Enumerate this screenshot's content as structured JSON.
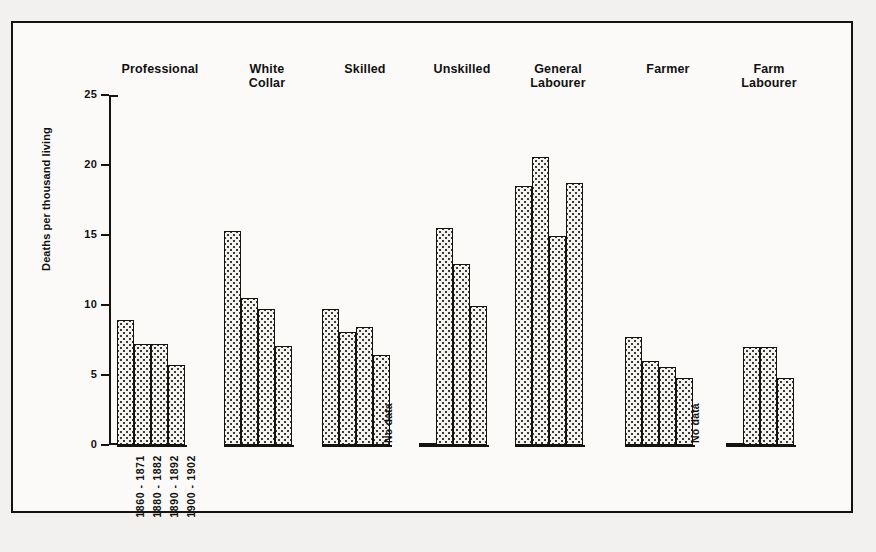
{
  "chart_data": {
    "type": "bar",
    "title": "",
    "xlabel": "",
    "ylabel": "Deaths per thousand living",
    "ylim": [
      0,
      25
    ],
    "yticks": [
      "0",
      "5",
      "10",
      "15",
      "20",
      "25"
    ],
    "grid": false,
    "legend_position": "none",
    "categories": [
      "Professional",
      "White Collar",
      "Skilled",
      "Unskilled",
      "General Labourer",
      "Farmer",
      "Farm Labourer"
    ],
    "periods": [
      "1860 - 1871",
      "1880 - 1882",
      "1890 - 1892",
      "1900 - 1902"
    ],
    "no_data_label": "No data",
    "series": [
      {
        "name": "1860 - 1871",
        "values": [
          8.9,
          15.3,
          9.7,
          null,
          18.5,
          7.7,
          null
        ]
      },
      {
        "name": "1880 - 1882",
        "values": [
          7.2,
          10.5,
          8.1,
          15.5,
          20.6,
          6.0,
          7.0
        ]
      },
      {
        "name": "1890 - 1892",
        "values": [
          7.2,
          9.7,
          8.4,
          12.9,
          14.9,
          5.6,
          7.0
        ]
      },
      {
        "name": "1900 - 1902",
        "values": [
          5.7,
          7.1,
          6.4,
          9.9,
          18.7,
          4.8,
          4.8
        ]
      }
    ],
    "groups": [
      {
        "label": "Professional",
        "bars": [
          {
            "period": "1860 - 1871",
            "value": 8.9
          },
          {
            "period": "1880 - 1882",
            "value": 7.2
          },
          {
            "period": "1890 - 1892",
            "value": 7.2
          },
          {
            "period": "1900 - 1902",
            "value": 5.7
          }
        ]
      },
      {
        "label": "White\nCollar",
        "bars": [
          {
            "period": "1860 - 1871",
            "value": 15.3
          },
          {
            "period": "1880 - 1882",
            "value": 10.5
          },
          {
            "period": "1890 - 1892",
            "value": 9.7
          },
          {
            "period": "1900 - 1902",
            "value": 7.1
          }
        ]
      },
      {
        "label": "Skilled",
        "bars": [
          {
            "period": "1860 - 1871",
            "value": 9.7
          },
          {
            "period": "1880 - 1882",
            "value": 8.1
          },
          {
            "period": "1890 - 1892",
            "value": 8.4
          },
          {
            "period": "1900 - 1902",
            "value": 6.4
          }
        ]
      },
      {
        "label": "Unskilled",
        "bars": [
          {
            "period": "1860 - 1871",
            "value": null
          },
          {
            "period": "1880 - 1882",
            "value": 15.5
          },
          {
            "period": "1890 - 1892",
            "value": 12.9
          },
          {
            "period": "1900 - 1902",
            "value": 9.9
          }
        ]
      },
      {
        "label": "General\nLabourer",
        "bars": [
          {
            "period": "1860 - 1871",
            "value": 18.5
          },
          {
            "period": "1880 - 1882",
            "value": 20.6
          },
          {
            "period": "1890 - 1892",
            "value": 14.9
          },
          {
            "period": "1900 - 1902",
            "value": 18.7
          }
        ]
      },
      {
        "label": "Farmer",
        "bars": [
          {
            "period": "1860 - 1871",
            "value": 7.7
          },
          {
            "period": "1880 - 1882",
            "value": 6.0
          },
          {
            "period": "1890 - 1892",
            "value": 5.6
          },
          {
            "period": "1900 - 1902",
            "value": 4.8
          }
        ]
      },
      {
        "label": "Farm\nLabourer",
        "bars": [
          {
            "period": "1860 - 1871",
            "value": null
          },
          {
            "period": "1880 - 1882",
            "value": 7.0
          },
          {
            "period": "1890 - 1892",
            "value": 7.0
          },
          {
            "period": "1900 - 1902",
            "value": 4.8
          }
        ]
      }
    ]
  }
}
